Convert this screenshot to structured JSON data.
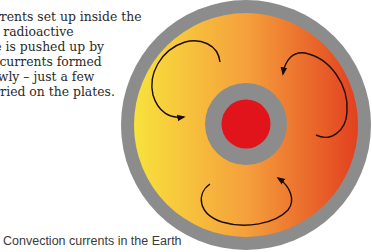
{
  "body_text": {
    "lines": [
      "currents set up inside the",
      "nal radioactive",
      "ace is pushed up by",
      "on currents formed",
      "slowly – just a few",
      "carried on the plates."
    ]
  },
  "caption": "Convection currents in the Earth",
  "diagram": {
    "layers": [
      "crust",
      "mantle",
      "outer core",
      "inner core"
    ],
    "arrows": [
      {
        "name": "convection-arrow-left",
        "direction": "clockwise"
      },
      {
        "name": "convection-arrow-right",
        "direction": "anticlockwise"
      },
      {
        "name": "convection-arrow-bottom",
        "direction": "anticlockwise"
      }
    ],
    "colors": {
      "crust": "#8c8c8c",
      "mantle_left": "#f8e23c",
      "mantle_mid": "#f5a03c",
      "mantle_right": "#e2401f",
      "outer_core": "#8c8c8c",
      "inner_core": "#e0141a",
      "arrow": "#1e0c08"
    }
  }
}
